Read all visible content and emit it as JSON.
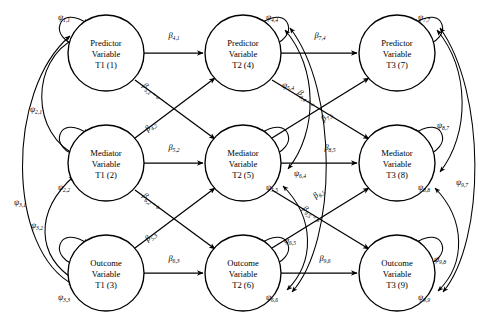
{
  "figure": {
    "type": "sem-path-diagram",
    "width": 478,
    "height": 325,
    "background": "#ffffff",
    "line_color": "#000000"
  },
  "nodes": [
    {
      "id": 1,
      "line1": "Predictor",
      "line2": "Variable",
      "line3": "T1 (1)",
      "cx": 106,
      "cy": 53,
      "r": 38,
      "row": 0,
      "col": 0
    },
    {
      "id": 2,
      "line1": "Mediator",
      "line2": "Variable",
      "line3": "T1 (2)",
      "cx": 106,
      "cy": 163,
      "r": 38,
      "row": 1,
      "col": 0
    },
    {
      "id": 3,
      "line1": "Outcome",
      "line2": "Variable",
      "line3": "T1 (3)",
      "cx": 106,
      "cy": 273,
      "r": 38,
      "row": 2,
      "col": 0
    },
    {
      "id": 4,
      "line1": "Predictor",
      "line2": "Variable",
      "line3": "T2 (4)",
      "cx": 243,
      "cy": 53,
      "r": 38,
      "row": 0,
      "col": 1
    },
    {
      "id": 5,
      "line1": "Mediator",
      "line2": "Variable",
      "line3": "T2 (5)",
      "cx": 243,
      "cy": 163,
      "r": 38,
      "row": 1,
      "col": 1
    },
    {
      "id": 6,
      "line1": "Outcome",
      "line2": "Variable",
      "line3": "T2 (6)",
      "cx": 243,
      "cy": 273,
      "r": 38,
      "row": 2,
      "col": 1
    },
    {
      "id": 7,
      "line1": "Predictor",
      "line2": "Variable",
      "line3": "T3 (7)",
      "cx": 397,
      "cy": 53,
      "r": 38,
      "row": 0,
      "col": 2
    },
    {
      "id": 8,
      "line1": "Mediator",
      "line2": "Variable",
      "line3": "T3 (8)",
      "cx": 397,
      "cy": 163,
      "r": 38,
      "row": 1,
      "col": 2
    },
    {
      "id": 9,
      "line1": "Outcome",
      "line2": "Variable",
      "line3": "T3 (9)",
      "cx": 397,
      "cy": 273,
      "r": 38,
      "row": 2,
      "col": 2
    }
  ],
  "beta_paths": [
    {
      "from": 1,
      "to": 4,
      "symbol": "β",
      "sub": "4,1",
      "label": "β",
      "constraint": "",
      "lx": 174,
      "ly": 38,
      "rot": 0,
      "kind": "autoregressive"
    },
    {
      "from": 2,
      "to": 5,
      "symbol": "β",
      "sub": "5,2",
      "label": "β",
      "constraint": "",
      "lx": 174,
      "ly": 150,
      "rot": 0,
      "kind": "autoregressive"
    },
    {
      "from": 3,
      "to": 6,
      "symbol": "β",
      "sub": "6,3",
      "label": "β",
      "constraint": "",
      "lx": 174,
      "ly": 261,
      "rot": 0,
      "kind": "autoregressive"
    },
    {
      "from": 1,
      "to": 5,
      "symbol": "β",
      "sub": "5,1",
      "label": "β",
      "constraint": " = a",
      "lx": 150,
      "ly": 93,
      "rot": 41,
      "kind": "cross-lagged"
    },
    {
      "from": 2,
      "to": 4,
      "symbol": "β",
      "sub": "4,2",
      "label": "β",
      "constraint": "",
      "lx": 152,
      "ly": 128,
      "rot": -41,
      "kind": "cross-lagged"
    },
    {
      "from": 2,
      "to": 6,
      "symbol": "β",
      "sub": "6,2",
      "label": "β",
      "constraint": " = b",
      "lx": 150,
      "ly": 203,
      "rot": 41,
      "kind": "cross-lagged"
    },
    {
      "from": 3,
      "to": 5,
      "symbol": "β",
      "sub": "5,3",
      "label": "β",
      "constraint": "",
      "lx": 152,
      "ly": 238,
      "rot": -41,
      "kind": "cross-lagged"
    },
    {
      "from": 4,
      "to": 7,
      "symbol": "β",
      "sub": "7,4",
      "label": "β",
      "constraint": "",
      "lx": 320,
      "ly": 38,
      "rot": 0,
      "kind": "autoregressive"
    },
    {
      "from": 5,
      "to": 8,
      "symbol": "β",
      "sub": "8,5",
      "label": "β",
      "constraint": "",
      "lx": 330,
      "ly": 150,
      "rot": 0,
      "kind": "autoregressive"
    },
    {
      "from": 6,
      "to": 9,
      "symbol": "β",
      "sub": "9,6",
      "label": "β",
      "constraint": "",
      "lx": 325,
      "ly": 261,
      "rot": 0,
      "kind": "autoregressive"
    },
    {
      "from": 4,
      "to": 8,
      "symbol": "β",
      "sub": "8,4",
      "label": "β",
      "constraint": " = a",
      "lx": 305,
      "ly": 100,
      "rot": 41,
      "kind": "cross-lagged"
    },
    {
      "from": 5,
      "to": 7,
      "symbol": "β",
      "sub": "7,5",
      "label": "β",
      "constraint": "",
      "lx": 328,
      "ly": 118,
      "rot": -41,
      "kind": "cross-lagged"
    },
    {
      "from": 5,
      "to": 9,
      "symbol": "β",
      "sub": "9,5",
      "label": "β",
      "constraint": " = b",
      "lx": 310,
      "ly": 216,
      "rot": 41,
      "kind": "cross-lagged"
    },
    {
      "from": 6,
      "to": 8,
      "symbol": "β",
      "sub": "8,5b",
      "label": "β",
      "constraint": "",
      "lx": 320,
      "ly": 195,
      "rot": -41,
      "kind": "cross-lagged"
    }
  ],
  "psi_self": [
    {
      "node": 1,
      "symbol": "ψ",
      "sub": "1,1",
      "lx": 64,
      "ly": 20
    },
    {
      "node": 2,
      "symbol": "ψ",
      "sub": "2,2",
      "lx": 64,
      "ly": 190
    },
    {
      "node": 3,
      "symbol": "ψ",
      "sub": "3,3",
      "lx": 64,
      "ly": 300
    },
    {
      "node": 4,
      "symbol": "ψ",
      "sub": "4,4",
      "lx": 272,
      "ly": 20
    },
    {
      "node": 5,
      "symbol": "ψ",
      "sub": "5,5",
      "lx": 272,
      "ly": 190
    },
    {
      "node": 6,
      "symbol": "ψ",
      "sub": "6,6",
      "lx": 272,
      "ly": 300
    },
    {
      "node": 7,
      "symbol": "ψ",
      "sub": "7,7",
      "lx": 424,
      "ly": 20
    },
    {
      "node": 8,
      "symbol": "ψ",
      "sub": "8,8",
      "lx": 424,
      "ly": 190
    },
    {
      "node": 9,
      "symbol": "ψ",
      "sub": "9,9",
      "lx": 424,
      "ly": 300
    }
  ],
  "psi_cov": [
    {
      "from": 2,
      "to": 1,
      "symbol": "ψ",
      "sub": "2,1",
      "lx": 36,
      "ly": 112
    },
    {
      "from": 3,
      "to": 1,
      "symbol": "ψ",
      "sub": "3,1",
      "lx": 20,
      "ly": 205
    },
    {
      "from": 3,
      "to": 2,
      "symbol": "ψ",
      "sub": "3,2",
      "lx": 37,
      "ly": 228
    },
    {
      "from": 5,
      "to": 4,
      "symbol": "ψ",
      "sub": "5,4",
      "lx": 288,
      "ly": 88
    },
    {
      "from": 6,
      "to": 4,
      "symbol": "ψ",
      "sub": "6,4",
      "lx": 300,
      "ly": 176
    },
    {
      "from": 6,
      "to": 5,
      "symbol": "ψ",
      "sub": "6,5",
      "lx": 290,
      "ly": 243
    },
    {
      "from": 8,
      "to": 7,
      "symbol": "ψ",
      "sub": "8,7",
      "lx": 443,
      "ly": 128
    },
    {
      "from": 9,
      "to": 7,
      "symbol": "ψ",
      "sub": "9,7",
      "lx": 462,
      "ly": 185
    },
    {
      "from": 9,
      "to": 8,
      "symbol": "ψ",
      "sub": "9,8",
      "lx": 440,
      "ly": 262
    }
  ]
}
